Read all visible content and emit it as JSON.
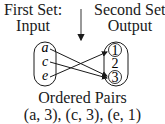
{
  "first_set": {
    "title": "First Set:",
    "subtitle": "Input",
    "elements": [
      "a",
      "c",
      "e"
    ]
  },
  "second_set": {
    "title": "Second Set:",
    "subtitle": "Output",
    "elements": [
      "1",
      "2",
      "3"
    ],
    "circled": [
      "1",
      "3"
    ]
  },
  "mappings": [
    {
      "from": "a",
      "to": "3"
    },
    {
      "from": "c",
      "to": "3"
    },
    {
      "from": "e",
      "to": "1"
    }
  ],
  "caption": {
    "title": "Ordered Pairs",
    "pairs": "(a, 3), (c, 3), (e, 1)"
  }
}
